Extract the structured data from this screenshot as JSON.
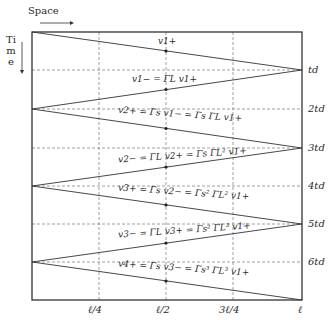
{
  "diagram": {
    "title_axis_space": "Space",
    "title_axis_time": "Time",
    "x_ticks": [
      {
        "label": "ℓ/4",
        "x": 99
      },
      {
        "label": "ℓ/2",
        "x": 166
      },
      {
        "label": "3ℓ/4",
        "x": 233
      },
      {
        "label": "ℓ",
        "x": 302
      }
    ],
    "t_ticks": [
      {
        "label": "t_d",
        "display": "td",
        "y": 70
      },
      {
        "label": "2t_d",
        "display": "2td",
        "y": 109
      },
      {
        "label": "3t_d",
        "display": "3td",
        "y": 148
      },
      {
        "label": "4t_d",
        "display": "4td",
        "y": 186
      },
      {
        "label": "5t_d",
        "display": "5td",
        "y": 224
      },
      {
        "label": "6t_d",
        "display": "6td",
        "y": 262
      }
    ],
    "equations": [
      {
        "id": "v1p",
        "text": "v1+"
      },
      {
        "id": "v1m",
        "text": "v1− = ΓL v1+"
      },
      {
        "id": "v2p",
        "text": "v2+ = Γs v1− = Γs ΓL v1+"
      },
      {
        "id": "v2m",
        "text": "v2− = ΓL v2+ = Γs ΓL² v1+"
      },
      {
        "id": "v3p",
        "text": "v3+ = Γs v2− = Γs² ΓL² v1+"
      },
      {
        "id": "v3m",
        "text": "v3− = ΓL v3+ = Γs² ΓL³ v1+"
      },
      {
        "id": "v4p",
        "text": "v4+ = Γs v3− = Γs³ ΓL³ v1+"
      }
    ],
    "colors": {
      "line": "#333333",
      "grid": "#777777",
      "frame": "#333333"
    }
  }
}
